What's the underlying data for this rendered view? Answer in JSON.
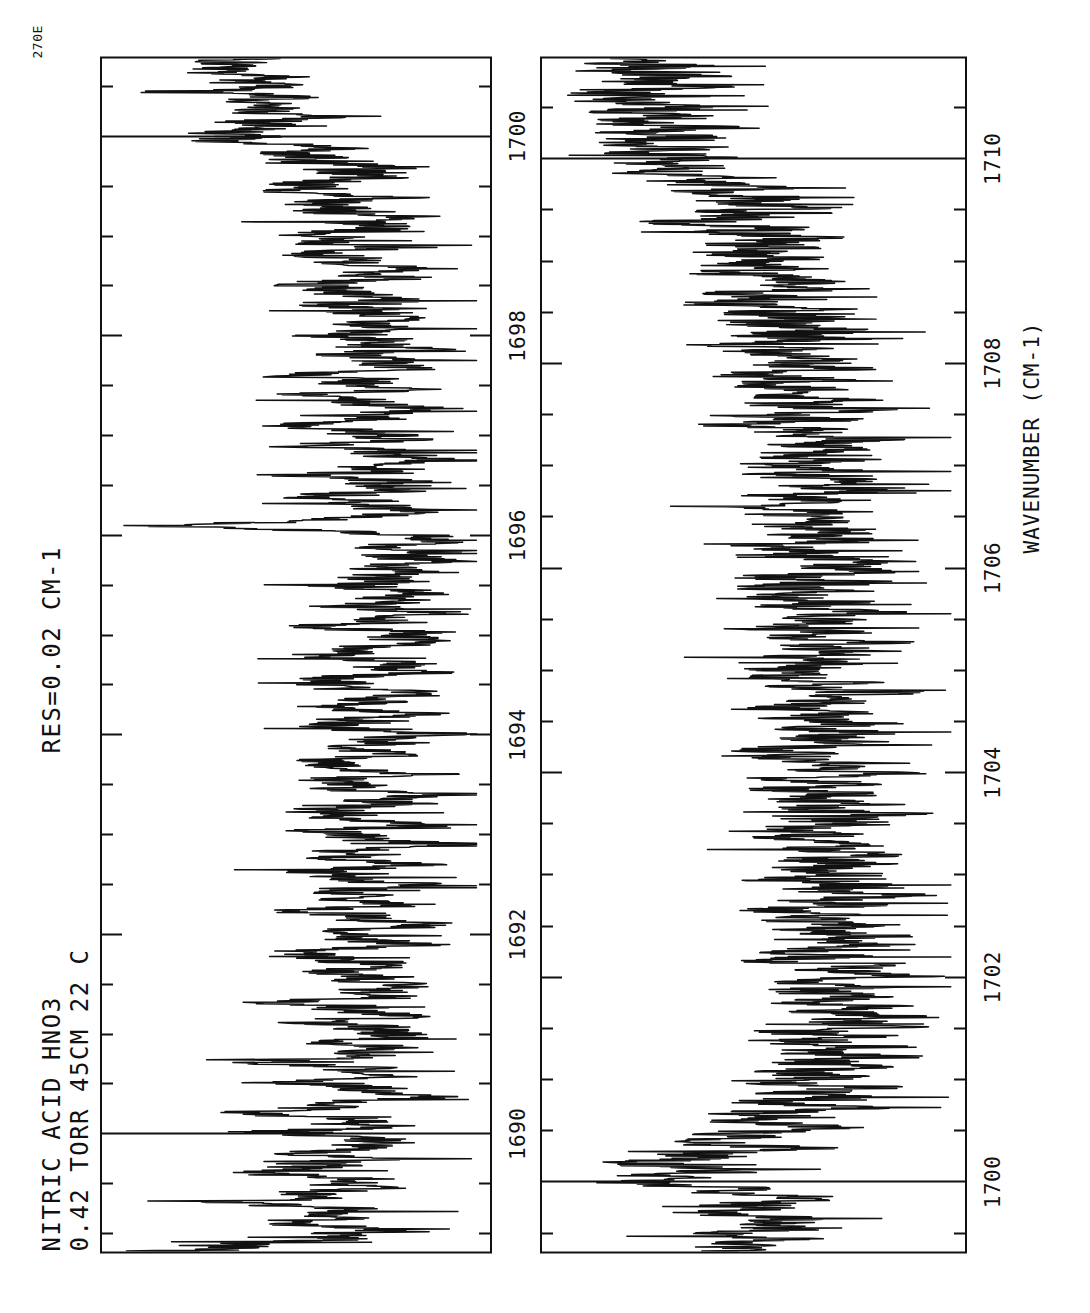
{
  "header": {
    "line1": "NITRIC ACID  HNO3",
    "line2": "0.42 TORR  45CM  22 C",
    "line3": "RES=0.02 CM-1",
    "corner_tag": "270E"
  },
  "axis": {
    "xlabel": "WAVENUMBER (CM-1)"
  },
  "panels": [
    {
      "name": "panel-top",
      "xlim": [
        1688.8,
        1700.8
      ],
      "major_ticks": [
        1690,
        1692,
        1694,
        1696,
        1698,
        1700
      ],
      "major_tick_labels": [
        "1690",
        "1692",
        "1694",
        "1696",
        "1698",
        "1700"
      ],
      "minor_tick_step": 0.5,
      "gridlines": [
        1690,
        1700
      ]
    },
    {
      "name": "panel-bot",
      "xlim": [
        1699.3,
        1711.0
      ],
      "major_ticks": [
        1700,
        1702,
        1704,
        1706,
        1708,
        1710
      ],
      "major_tick_labels": [
        "1700",
        "1702",
        "1704",
        "1706",
        "1708",
        "1710"
      ],
      "minor_tick_step": 0.5,
      "gridlines": [
        1700,
        1710
      ]
    }
  ],
  "chart_data": {
    "type": "line",
    "title": "NITRIC ACID  HNO3",
    "subtitle": "0.42 TORR  45CM  22 C   RES=0.02 CM-1",
    "xlabel": "WAVENUMBER (CM-1)",
    "ylabel": "TRANSMITTANCE",
    "grid": true,
    "legend": "none",
    "orientation": "rotated-90-ccw",
    "series": [
      {
        "name": "panel-top-transmission",
        "xlim": [
          1688.8,
          1700.8
        ],
        "ylim": [
          0,
          1
        ],
        "x": [
          1688.8,
          1688.9,
          1689.0,
          1689.1,
          1689.2,
          1689.3,
          1689.4,
          1689.5,
          1689.6,
          1689.7,
          1689.8,
          1689.9,
          1690.0,
          1690.1,
          1690.2,
          1690.3,
          1690.4,
          1690.5,
          1690.6,
          1690.7,
          1690.8,
          1690.9,
          1691.0,
          1691.1,
          1691.2,
          1691.3,
          1691.4,
          1691.5,
          1691.6,
          1691.7,
          1691.8,
          1691.9,
          1692.0,
          1692.1,
          1692.2,
          1692.3,
          1692.4,
          1692.5,
          1692.6,
          1692.7,
          1692.8,
          1692.9,
          1693.0,
          1693.1,
          1693.2,
          1693.3,
          1693.4,
          1693.5,
          1693.6,
          1693.7,
          1693.8,
          1693.9,
          1694.0,
          1694.1,
          1694.2,
          1694.3,
          1694.4,
          1694.5,
          1694.6,
          1694.7,
          1694.8,
          1694.9,
          1695.0,
          1695.1,
          1695.2,
          1695.3,
          1695.4,
          1695.5,
          1695.6,
          1695.7,
          1695.8,
          1695.9,
          1696.0,
          1696.1,
          1696.2,
          1696.3,
          1696.4,
          1696.5,
          1696.6,
          1696.7,
          1696.8,
          1696.9,
          1697.0,
          1697.1,
          1697.2,
          1697.3,
          1697.4,
          1697.5,
          1697.6,
          1697.7,
          1697.8,
          1697.9,
          1698.0,
          1698.1,
          1698.2,
          1698.3,
          1698.4,
          1698.5,
          1698.6,
          1698.7,
          1698.8,
          1698.9,
          1699.0,
          1699.1,
          1699.2,
          1699.3,
          1699.4,
          1699.5,
          1699.6,
          1699.7,
          1699.8,
          1699.9,
          1700.0,
          1700.1,
          1700.2,
          1700.3,
          1700.4,
          1700.5,
          1700.6,
          1700.7,
          1700.8
        ],
        "y": [
          0.93,
          0.55,
          0.35,
          0.6,
          0.4,
          0.7,
          0.45,
          0.38,
          0.66,
          0.42,
          0.52,
          0.3,
          0.58,
          0.35,
          0.62,
          0.38,
          0.28,
          0.55,
          0.33,
          0.6,
          0.36,
          0.44,
          0.25,
          0.52,
          0.3,
          0.58,
          0.34,
          0.27,
          0.5,
          0.32,
          0.56,
          0.29,
          0.46,
          0.24,
          0.54,
          0.31,
          0.48,
          0.26,
          0.53,
          0.3,
          0.45,
          0.22,
          0.5,
          0.28,
          0.55,
          0.32,
          0.26,
          0.48,
          0.3,
          0.52,
          0.27,
          0.44,
          0.23,
          0.5,
          0.29,
          0.46,
          0.25,
          0.51,
          0.33,
          0.28,
          0.47,
          0.3,
          0.24,
          0.45,
          0.26,
          0.38,
          0.22,
          0.42,
          0.27,
          0.33,
          0.2,
          0.3,
          0.18,
          0.88,
          0.35,
          0.3,
          0.52,
          0.28,
          0.46,
          0.32,
          0.24,
          0.5,
          0.3,
          0.55,
          0.34,
          0.26,
          0.48,
          0.31,
          0.53,
          0.29,
          0.42,
          0.25,
          0.49,
          0.33,
          0.27,
          0.51,
          0.3,
          0.56,
          0.35,
          0.28,
          0.52,
          0.33,
          0.58,
          0.37,
          0.3,
          0.54,
          0.36,
          0.6,
          0.4,
          0.34,
          0.62,
          0.45,
          0.8,
          0.66,
          0.58,
          0.7,
          0.62,
          0.72,
          0.66,
          0.74,
          0.7
        ]
      },
      {
        "name": "panel-bot-transmission",
        "xlim": [
          1699.3,
          1711.0
        ],
        "ylim": [
          0,
          1
        ],
        "x": [
          1699.3,
          1699.4,
          1699.5,
          1699.6,
          1699.7,
          1699.8,
          1699.9,
          1700.0,
          1700.1,
          1700.2,
          1700.3,
          1700.4,
          1700.5,
          1700.6,
          1700.7,
          1700.8,
          1700.9,
          1701.0,
          1701.2,
          1701.4,
          1701.6,
          1701.8,
          1702.0,
          1702.2,
          1702.4,
          1702.6,
          1702.8,
          1703.0,
          1703.2,
          1703.4,
          1703.6,
          1703.8,
          1704.0,
          1704.2,
          1704.4,
          1704.6,
          1704.8,
          1705.0,
          1705.2,
          1705.4,
          1705.6,
          1705.8,
          1706.0,
          1706.2,
          1706.4,
          1706.6,
          1706.8,
          1707.0,
          1707.2,
          1707.4,
          1707.6,
          1707.8,
          1708.0,
          1708.2,
          1708.4,
          1708.6,
          1708.8,
          1709.0,
          1709.2,
          1709.4,
          1709.6,
          1709.8,
          1710.0,
          1710.2,
          1710.4,
          1710.6,
          1710.8,
          1711.0
        ],
        "y": [
          0.7,
          0.55,
          0.62,
          0.5,
          0.64,
          0.52,
          0.58,
          0.9,
          0.72,
          0.8,
          0.6,
          0.68,
          0.45,
          0.58,
          0.4,
          0.52,
          0.36,
          0.48,
          0.34,
          0.44,
          0.3,
          0.42,
          0.32,
          0.46,
          0.33,
          0.47,
          0.31,
          0.45,
          0.34,
          0.48,
          0.32,
          0.46,
          0.35,
          0.49,
          0.33,
          0.47,
          0.36,
          0.5,
          0.34,
          0.48,
          0.37,
          0.51,
          0.35,
          0.49,
          0.38,
          0.52,
          0.36,
          0.5,
          0.39,
          0.53,
          0.41,
          0.55,
          0.43,
          0.57,
          0.45,
          0.59,
          0.47,
          0.62,
          0.5,
          0.66,
          0.55,
          0.7,
          0.78,
          0.84,
          0.8,
          0.86,
          0.82,
          0.88
        ]
      }
    ]
  }
}
